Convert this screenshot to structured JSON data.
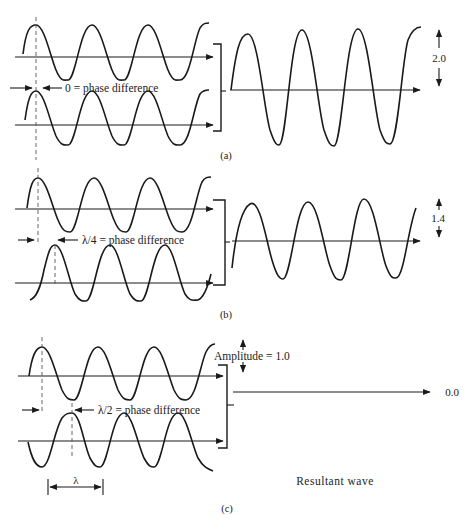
{
  "diagram": {
    "panels": [
      {
        "id": "a",
        "caption": "(a)",
        "phase_label": "0 = phase difference",
        "phase_difference": "0",
        "resultant_amplitude_label": "2.0",
        "resultant_amplitude": 2.0
      },
      {
        "id": "b",
        "caption": "(b)",
        "phase_label": "λ/4 = phase difference",
        "phase_difference": "λ/4",
        "resultant_amplitude_label": "1.4",
        "resultant_amplitude": 1.4
      },
      {
        "id": "c",
        "caption": "(c)",
        "phase_label": "λ/2 = phase difference",
        "phase_difference": "λ/2",
        "amplitude_label": "Amplitude = 1.0",
        "resultant_amplitude_label": "0.0",
        "resultant_amplitude": 0.0,
        "wavelength_label": "λ",
        "resultant_caption": "Resultant wave"
      }
    ],
    "colors": {
      "stroke": "#1a1a1a",
      "background": "#ffffff",
      "dash": "#555555"
    }
  }
}
